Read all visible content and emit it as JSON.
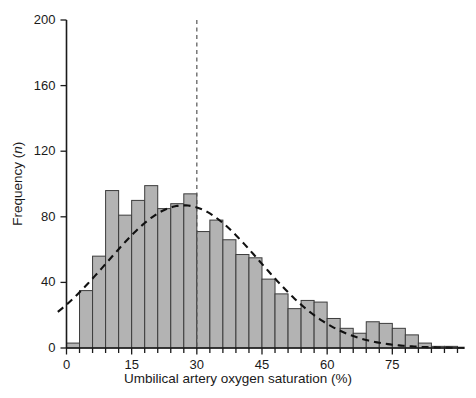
{
  "chart_data": {
    "type": "bar",
    "title": "",
    "subtitle": "",
    "xlabel": "Umbilical artery oxygen saturation (%)",
    "ylabel": "Frequency (n)",
    "ylabel_plain": "Frequency",
    "ylabel_symbol": "n",
    "ylabel_suffix": ")",
    "ylabel_prefix": " (",
    "xlim": [
      0,
      91.5
    ],
    "ylim": [
      0,
      200
    ],
    "grid": false,
    "legend": null,
    "bar_fill_color": "#b3b3b3",
    "bar_edge_color": "#3c3c3c",
    "curve_color": "#111111",
    "axis_color": "#1a1a1a",
    "bin_width": 3,
    "x_ticks_major": [
      0,
      15,
      30,
      45,
      60,
      75
    ],
    "x_ticks_minor_step": 3,
    "x_tick_labels": [
      "0",
      "15",
      "30",
      "45",
      "60",
      "75"
    ],
    "y_ticks": [
      0,
      40,
      80,
      120,
      160,
      200
    ],
    "y_tick_labels": [
      "0",
      "40",
      "80",
      "120",
      "160",
      "200"
    ],
    "annotations": [
      {
        "name": "median-reference-line",
        "type": "vline",
        "x": 30,
        "style": "dashed",
        "color": "#555555"
      },
      {
        "name": "fitted-normal-curve",
        "type": "curve",
        "style": "dashed",
        "color": "#111111",
        "peak_x": 27,
        "peak_y": 87,
        "sigma": 17.5
      }
    ],
    "bins": [
      {
        "x0": 0,
        "x1": 3,
        "value": 3
      },
      {
        "x0": 3,
        "x1": 6,
        "value": 35
      },
      {
        "x0": 6,
        "x1": 9,
        "value": 56
      },
      {
        "x0": 9,
        "x1": 12,
        "value": 96
      },
      {
        "x0": 12,
        "x1": 15,
        "value": 81
      },
      {
        "x0": 15,
        "x1": 18,
        "value": 90
      },
      {
        "x0": 18,
        "x1": 21,
        "value": 99
      },
      {
        "x0": 21,
        "x1": 24,
        "value": 85
      },
      {
        "x0": 24,
        "x1": 27,
        "value": 88
      },
      {
        "x0": 27,
        "x1": 30,
        "value": 94
      },
      {
        "x0": 30,
        "x1": 33,
        "value": 71
      },
      {
        "x0": 33,
        "x1": 36,
        "value": 78
      },
      {
        "x0": 36,
        "x1": 39,
        "value": 66
      },
      {
        "x0": 39,
        "x1": 42,
        "value": 57
      },
      {
        "x0": 42,
        "x1": 45,
        "value": 55
      },
      {
        "x0": 45,
        "x1": 48,
        "value": 42
      },
      {
        "x0": 48,
        "x1": 51,
        "value": 33
      },
      {
        "x0": 51,
        "x1": 54,
        "value": 24
      },
      {
        "x0": 54,
        "x1": 57,
        "value": 29
      },
      {
        "x0": 57,
        "x1": 60,
        "value": 28
      },
      {
        "x0": 60,
        "x1": 63,
        "value": 18
      },
      {
        "x0": 63,
        "x1": 66,
        "value": 12
      },
      {
        "x0": 66,
        "x1": 69,
        "value": 9
      },
      {
        "x0": 69,
        "x1": 72,
        "value": 16
      },
      {
        "x0": 72,
        "x1": 75,
        "value": 15
      },
      {
        "x0": 75,
        "x1": 78,
        "value": 12
      },
      {
        "x0": 78,
        "x1": 81,
        "value": 8
      },
      {
        "x0": 81,
        "x1": 84,
        "value": 3
      },
      {
        "x0": 84,
        "x1": 87,
        "value": 1
      },
      {
        "x0": 87,
        "x1": 90,
        "value": 1
      }
    ]
  }
}
